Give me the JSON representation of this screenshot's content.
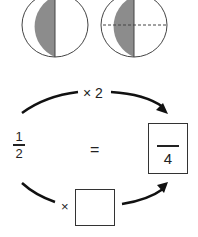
{
  "circles": [
    {
      "name": "half-circle",
      "shaded": "left-half",
      "dashed_divider": false
    },
    {
      "name": "quarters-circle",
      "shaded": "left-half",
      "dashed_divider": true
    }
  ],
  "colors": {
    "shade": "#8c8c8c",
    "stroke": "#333333",
    "text": "#222222"
  },
  "equation": {
    "left_fraction": {
      "numerator": "1",
      "denominator": "2"
    },
    "equals": "=",
    "top_operation": "× 2",
    "bottom_operation_symbol": "×",
    "bottom_operation_value": "",
    "answer": {
      "numerator": "",
      "denominator": "4"
    }
  }
}
